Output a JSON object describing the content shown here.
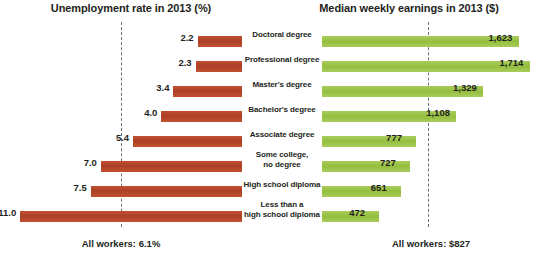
{
  "chart_data": {
    "type": "bar",
    "layout": "bidirectional-pyramid",
    "left_title": "Unemployment rate in 2013 (%)",
    "right_title": "Median weekly earnings in 2013 ($)",
    "categories": [
      "Doctoral degree",
      "Professional degree",
      "Master's degree",
      "Bachelor's degree",
      "Associate  degree",
      "Some college,\nno degree",
      "High school diploma",
      "Less than a\nhigh school diploma"
    ],
    "series": [
      {
        "name": "Unemployment rate in 2013 (%)",
        "side": "left",
        "color": "#b5432a",
        "unit": "%",
        "values": [
          2.2,
          2.3,
          3.4,
          4.0,
          5.4,
          7.0,
          7.5,
          11.0
        ],
        "labels": [
          "2.2",
          "2.3",
          "3.4",
          "4.0",
          "5.4",
          "7.0",
          "7.5",
          "11.0"
        ],
        "axis_max": 12.0,
        "average": 6.1,
        "average_label": "All workers: 6.1%"
      },
      {
        "name": "Median weekly earnings in 2013 ($)",
        "side": "right",
        "color": "#9fc54d",
        "unit": "$",
        "values": [
          1623,
          1714,
          1329,
          1108,
          777,
          727,
          651,
          472
        ],
        "labels": [
          "1,623",
          "1,714",
          "1,329",
          "1,108",
          "777",
          "727",
          "651",
          "472"
        ],
        "axis_max": 1800,
        "average": 827,
        "average_label": "All workers: $827"
      }
    ],
    "grid": false,
    "legend": "none",
    "xlabel": "",
    "ylabel": ""
  },
  "titles": {
    "left": "Unemployment rate in 2013 (%)",
    "right": "Median weekly earnings in 2013 ($)"
  },
  "footers": {
    "left": "All workers: 6.1%",
    "right": "All workers: $827"
  },
  "rows": [
    {
      "category": "Doctoral degree",
      "line2": "",
      "rate": "2.2",
      "earn": "1,623"
    },
    {
      "category": "Professional degree",
      "line2": "",
      "rate": "2.3",
      "earn": "1,714"
    },
    {
      "category": "Master's degree",
      "line2": "",
      "rate": "3.4",
      "earn": "1,329"
    },
    {
      "category": "Bachelor's degree",
      "line2": "",
      "rate": "4.0",
      "earn": "1,108"
    },
    {
      "category": "Associate  degree",
      "line2": "",
      "rate": "5.4",
      "earn": "777"
    },
    {
      "category": "Some college,",
      "line2": "no degree",
      "rate": "7.0",
      "earn": "727"
    },
    {
      "category": "High school diploma",
      "line2": "",
      "rate": "7.5",
      "earn": "651"
    },
    {
      "category": "Less than a",
      "line2": "high school diploma",
      "rate": "11.0",
      "earn": "472"
    }
  ],
  "colors": {
    "unemployment_bar": "#b5432a",
    "earnings_bar": "#9fc54d",
    "average_line": "#6d6e71",
    "text": "#231f20",
    "background": "#ffffff"
  }
}
